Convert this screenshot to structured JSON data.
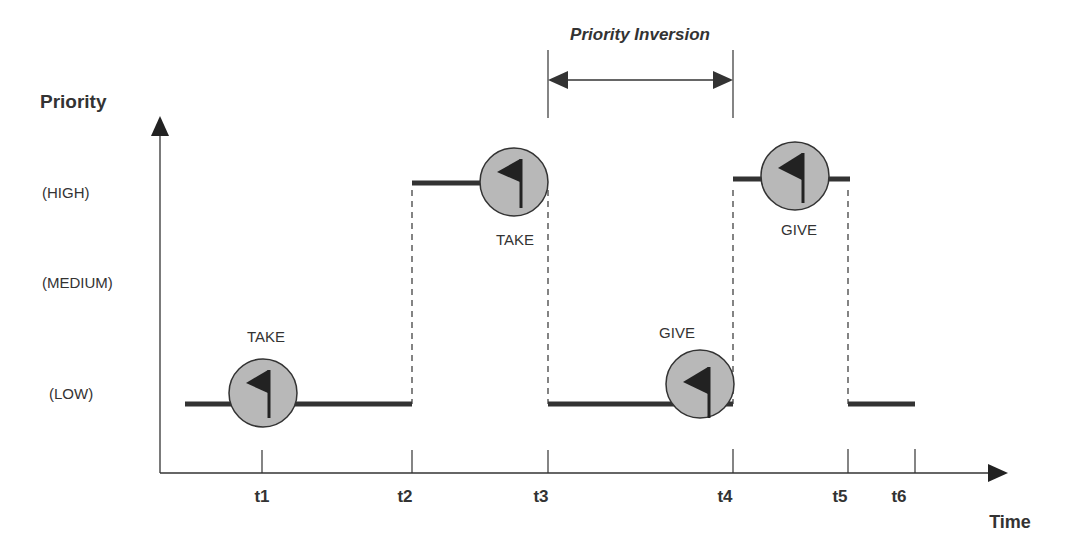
{
  "title": "Priority Inversion",
  "axes": {
    "y_label": "Priority",
    "x_label": "Time",
    "levels": [
      {
        "key": "high",
        "label": "(HIGH)"
      },
      {
        "key": "medium",
        "label": "(MEDIUM)"
      },
      {
        "key": "low",
        "label": "(LOW)"
      }
    ],
    "ticks": [
      "t1",
      "t2",
      "t3",
      "t4",
      "t5",
      "t6"
    ]
  },
  "events": [
    {
      "label": "TAKE",
      "time": "t1",
      "level": "LOW"
    },
    {
      "label": "TAKE",
      "time": "between t2 and t3",
      "level": "HIGH"
    },
    {
      "label": "GIVE",
      "time": "just before t4",
      "level": "LOW"
    },
    {
      "label": "GIVE",
      "time": "between t4 and t5",
      "level": "HIGH"
    }
  ],
  "segments": [
    {
      "from": "start",
      "to": "t2",
      "level": "LOW"
    },
    {
      "from": "t2",
      "to": "t3",
      "level": "HIGH"
    },
    {
      "from": "t3",
      "to": "t4",
      "level": "LOW"
    },
    {
      "from": "t4",
      "to": "t5",
      "level": "HIGH"
    },
    {
      "from": "t5",
      "to": "t6",
      "level": "LOW"
    }
  ],
  "inversion_span": {
    "label": "Priority Inversion",
    "from": "t3",
    "to": "t4"
  },
  "colors": {
    "line": "#333333",
    "circle_fill": "#b8b8b8",
    "flag": "#222222",
    "text": "#333333"
  }
}
